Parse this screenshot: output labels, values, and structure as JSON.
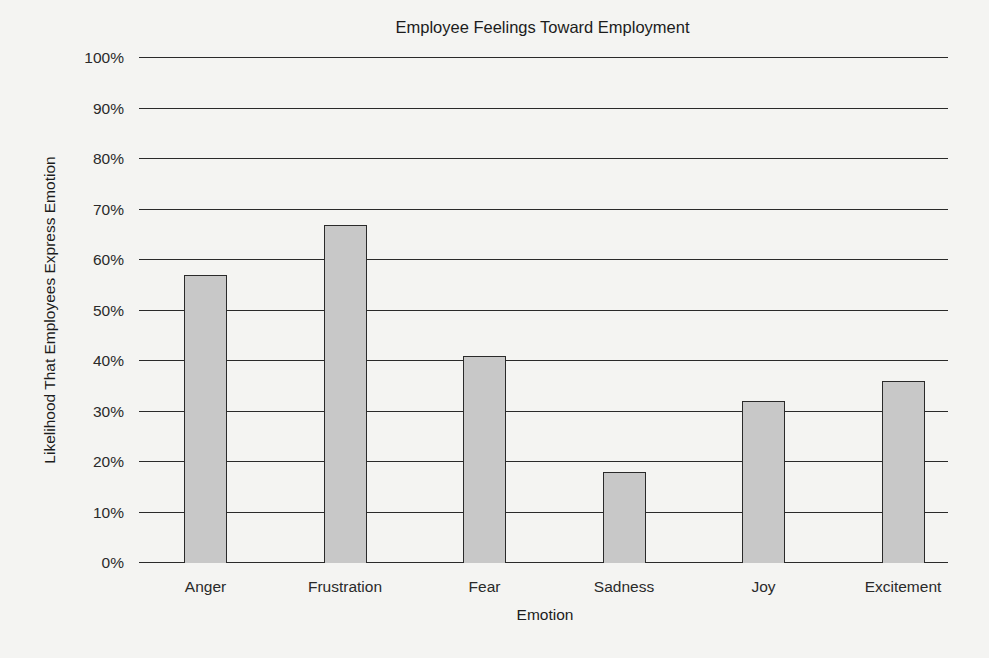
{
  "chart_data": {
    "type": "bar",
    "title": "Employee Feelings Toward Employment",
    "xlabel": "Emotion",
    "ylabel": "Likelihood That Employees Express Emotion",
    "categories": [
      "Anger",
      "Frustration",
      "Fear",
      "Sadness",
      "Joy",
      "Excitement"
    ],
    "values": [
      57,
      67,
      41,
      18,
      32,
      36
    ],
    "value_unit": "%",
    "ylim": [
      0,
      100
    ],
    "yticks": [
      "0%",
      "10%",
      "20%",
      "30%",
      "40%",
      "50%",
      "60%",
      "70%",
      "80%",
      "90%",
      "100%"
    ],
    "grid": true,
    "legend": null,
    "bar_color": "#c8c8c8",
    "edge_color": "#2a2a2a"
  }
}
